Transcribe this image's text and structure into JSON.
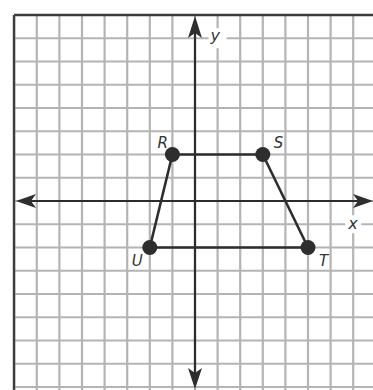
{
  "diagram": {
    "type": "coordinate-plane",
    "axes": {
      "x_label": "x",
      "y_label": "y",
      "x_range": [
        -8,
        8
      ],
      "y_range": [
        -8,
        8
      ],
      "grid": true,
      "grid_step": 1
    },
    "points": [
      {
        "label": "R",
        "x": -1,
        "y": 2
      },
      {
        "label": "S",
        "x": 3,
        "y": 2
      },
      {
        "label": "T",
        "x": 5,
        "y": -2
      },
      {
        "label": "U",
        "x": -2,
        "y": -2
      }
    ],
    "polygon": {
      "name": "trapezoid RSTU",
      "vertices": [
        "R",
        "S",
        "T",
        "U"
      ]
    },
    "colors": {
      "grid": "#b4b4b4",
      "axes": "#2c2c2c",
      "figure": "#2e2e2e",
      "background": "#ffffff"
    }
  }
}
